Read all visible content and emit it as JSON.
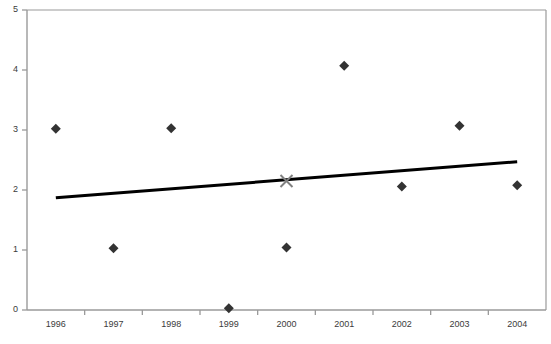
{
  "chart_data": {
    "type": "scatter",
    "title": "",
    "xlabel": "",
    "ylabel": "",
    "categories": [
      "1996",
      "1997",
      "1998",
      "1999",
      "2000",
      "2001",
      "2002",
      "2003",
      "2004"
    ],
    "x": [
      1996,
      1997,
      1998,
      1999,
      2000,
      2001,
      2002,
      2003,
      2004
    ],
    "xlim": [
      1995.5,
      2004.6
    ],
    "ylim": [
      0,
      5
    ],
    "y_ticks": [
      0,
      1,
      2,
      3,
      4,
      5
    ],
    "y_tick_labels": [
      "0",
      "1",
      "2",
      "3",
      "4",
      "5"
    ],
    "x_tick_labels": [
      "1996",
      "1997",
      "1998",
      "1999",
      "2000",
      "2001",
      "2002",
      "2003",
      "2004"
    ],
    "grid": false,
    "legend": null,
    "legend_position": "none",
    "series": [
      {
        "name": "data",
        "marker": "diamond",
        "color": "#333333",
        "values": [
          3.02,
          1.03,
          3.03,
          0.03,
          1.04,
          4.07,
          2.06,
          3.07,
          2.08
        ]
      },
      {
        "name": "highlight",
        "marker": "x-cross",
        "color": "#808080",
        "points": [
          {
            "x": 2000,
            "y": 2.15
          }
        ]
      }
    ],
    "trendline": {
      "type": "line",
      "color": "#000000",
      "width": 3,
      "x_start": 1996,
      "y_start": 1.87,
      "x_end": 2004,
      "y_end": 2.47
    },
    "axes": {
      "axis_color": "#9a9a9a",
      "tick_color": "#9a9a9a",
      "left_axis": true,
      "bottom_axis": true,
      "top_axis": true,
      "right_axis": true
    }
  },
  "a11y": {
    "chart_name": "scatter-plot-with-trendline",
    "y_axis_name": "value-axis",
    "x_axis_name": "year-axis"
  }
}
